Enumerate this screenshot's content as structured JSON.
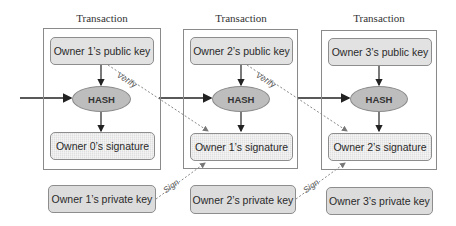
{
  "diagram": {
    "transactions": [
      {
        "title": "Transaction",
        "public_key": "Owner 1’s public key",
        "hash": "HASH",
        "signature": "Owner 0’s signature",
        "private_key": "Owner 1’s private key"
      },
      {
        "title": "Transaction",
        "public_key": "Owner 2’s public key",
        "hash": "HASH",
        "signature": "Owner 1’s signature",
        "private_key": "Owner 2’s private key"
      },
      {
        "title": "Transaction",
        "public_key": "Owner 3’s public key",
        "hash": "HASH",
        "signature": "Owner 2’s signature",
        "private_key": "Owner 3’s private key"
      }
    ],
    "edge_labels": {
      "verify": "Verify",
      "sign": "Sign"
    },
    "colors": {
      "frame": "#8a8a8a",
      "node_fill": "#e2e2e2",
      "hash_fill": "#bdbdbd",
      "arrow": "#222222",
      "dotted": "#888888"
    }
  }
}
